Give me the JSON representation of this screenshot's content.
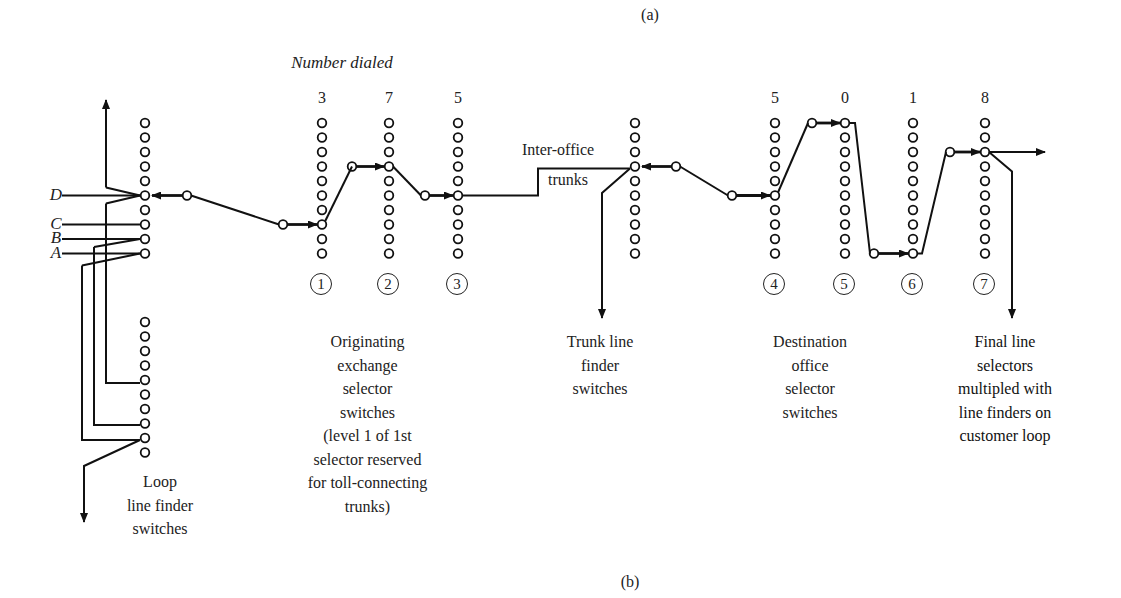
{
  "figure": {
    "part_a_label": "(a)",
    "part_b_label": "(b)",
    "number_dialed_title": "Number dialed",
    "digits": [
      "3",
      "7",
      "5",
      "5",
      "0",
      "1",
      "8"
    ],
    "stage_numbers": [
      "1",
      "2",
      "3",
      "4",
      "5",
      "6",
      "7"
    ],
    "line_labels": [
      "D",
      "C",
      "B",
      "A"
    ],
    "inter_office_label": "Inter-office",
    "trunks_label": "trunks",
    "captions": {
      "loop": "Loop\nline finder\nswitches",
      "originating": "Originating\nexchange\nselector\nswitches\n(level 1 of 1st\nselector reserved\nfor toll-connecting\ntrunks)",
      "trunk_finder": "Trunk line\nfinder\nswitches",
      "destination": "Destination\noffice\nselector\nswitches",
      "final": "Final line\nselectors\nmultipled with\nline finders on\ncustomer loop"
    }
  }
}
